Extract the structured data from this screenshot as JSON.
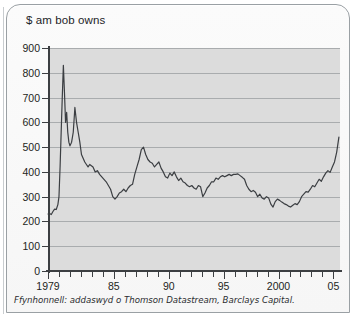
{
  "chart_data": {
    "type": "line",
    "title": "$ am bob owns",
    "xlabel": "",
    "ylabel": "",
    "ylim": [
      0,
      900
    ],
    "xlim": [
      1979,
      2005.6
    ],
    "ytick_values": [
      0,
      100,
      200,
      300,
      400,
      500,
      600,
      700,
      800,
      900
    ],
    "ytick_labels": [
      "0",
      "100",
      "200",
      "300",
      "400",
      "500",
      "600",
      "700",
      "800",
      "900"
    ],
    "xtick_values": [
      1979,
      1980,
      1981,
      1982,
      1983,
      1984,
      1985,
      1986,
      1987,
      1988,
      1989,
      1990,
      1991,
      1992,
      1993,
      1994,
      1995,
      1996,
      1997,
      1998,
      1999,
      2000,
      2001,
      2002,
      2003,
      2004,
      2005
    ],
    "xtick_labels_shown": [
      {
        "value": 1979,
        "label": "1979"
      },
      {
        "value": 1985,
        "label": "85"
      },
      {
        "value": 1990,
        "label": "90"
      },
      {
        "value": 1995,
        "label": "95"
      },
      {
        "value": 2000,
        "label": "2000"
      },
      {
        "value": 2005,
        "label": "05"
      }
    ],
    "grid": true,
    "grid_axis": "y",
    "legend": null,
    "series": [
      {
        "name": "$ am bob owns",
        "color": "#3b3e42",
        "x": [
          1979.0,
          1979.15,
          1979.3,
          1979.45,
          1979.6,
          1979.75,
          1979.9,
          1980.0,
          1980.1,
          1980.2,
          1980.3,
          1980.4,
          1980.5,
          1980.6,
          1980.7,
          1980.8,
          1980.9,
          1981.0,
          1981.15,
          1981.3,
          1981.45,
          1981.6,
          1981.75,
          1981.9,
          1982.05,
          1982.2,
          1982.35,
          1982.5,
          1982.65,
          1982.8,
          1982.95,
          1983.1,
          1983.3,
          1983.5,
          1983.7,
          1983.9,
          1984.1,
          1984.3,
          1984.5,
          1984.7,
          1984.9,
          1985.1,
          1985.3,
          1985.5,
          1985.7,
          1985.9,
          1986.1,
          1986.3,
          1986.5,
          1986.7,
          1986.9,
          1987.1,
          1987.3,
          1987.5,
          1987.7,
          1987.9,
          1988.1,
          1988.3,
          1988.5,
          1988.7,
          1988.9,
          1989.1,
          1989.3,
          1989.5,
          1989.7,
          1989.9,
          1990.1,
          1990.3,
          1990.5,
          1990.7,
          1990.9,
          1991.1,
          1991.3,
          1991.5,
          1991.7,
          1991.9,
          1992.1,
          1992.3,
          1992.5,
          1992.7,
          1992.9,
          1993.1,
          1993.3,
          1993.5,
          1993.7,
          1993.9,
          1994.1,
          1994.3,
          1994.5,
          1994.7,
          1994.9,
          1995.1,
          1995.3,
          1995.5,
          1995.7,
          1995.9,
          1996.1,
          1996.3,
          1996.5,
          1996.7,
          1996.9,
          1997.1,
          1997.3,
          1997.5,
          1997.7,
          1997.9,
          1998.1,
          1998.3,
          1998.5,
          1998.7,
          1998.9,
          1999.1,
          1999.3,
          1999.5,
          1999.7,
          1999.9,
          2000.1,
          2000.3,
          2000.5,
          2000.7,
          2000.9,
          2001.1,
          2001.3,
          2001.5,
          2001.7,
          2001.9,
          2002.1,
          2002.3,
          2002.5,
          2002.7,
          2002.9,
          2003.1,
          2003.3,
          2003.5,
          2003.7,
          2003.9,
          2004.1,
          2004.3,
          2004.5,
          2004.7,
          2004.9,
          2005.1,
          2005.3,
          2005.5
        ],
        "y": [
          230,
          232,
          228,
          240,
          250,
          248,
          268,
          300,
          420,
          560,
          700,
          830,
          720,
          600,
          640,
          560,
          520,
          505,
          520,
          560,
          660,
          600,
          560,
          520,
          470,
          455,
          440,
          430,
          420,
          430,
          425,
          420,
          400,
          405,
          390,
          380,
          370,
          360,
          345,
          330,
          300,
          290,
          300,
          315,
          320,
          330,
          320,
          335,
          345,
          350,
          390,
          420,
          450,
          490,
          500,
          470,
          450,
          440,
          435,
          420,
          430,
          440,
          415,
          400,
          380,
          375,
          395,
          385,
          400,
          380,
          365,
          375,
          360,
          355,
          345,
          340,
          345,
          335,
          330,
          345,
          340,
          300,
          315,
          335,
          345,
          360,
          360,
          375,
          370,
          380,
          385,
          380,
          385,
          390,
          385,
          390,
          390,
          392,
          385,
          378,
          370,
          345,
          330,
          320,
          325,
          318,
          300,
          310,
          295,
          290,
          300,
          295,
          270,
          258,
          280,
          290,
          285,
          278,
          272,
          268,
          262,
          258,
          265,
          272,
          268,
          280,
          300,
          310,
          320,
          318,
          330,
          345,
          340,
          355,
          370,
          362,
          380,
          395,
          405,
          398,
          420,
          440,
          480,
          540
        ]
      }
    ],
    "source_note": "Ffynhonnell: addaswyd o Thomson Datastream, Barclays Capital."
  }
}
